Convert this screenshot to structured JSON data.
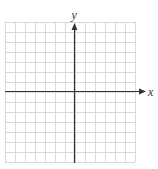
{
  "figure": {
    "cutoff_text": "",
    "x_label": "x",
    "y_label": "y",
    "grid": {
      "left": 5,
      "top": 22,
      "cell": 10,
      "cols": 13,
      "rows": 14,
      "color": "#d9d9d9"
    },
    "axes": {
      "origin_x": 74,
      "origin_y": 91,
      "color": "#333333"
    }
  }
}
